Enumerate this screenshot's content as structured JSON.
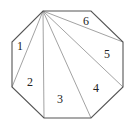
{
  "figure": {
    "vertices": [
      {
        "x": 43,
        "y": 11
      },
      {
        "x": 91,
        "y": 11
      },
      {
        "x": 123,
        "y": 42
      },
      {
        "x": 123,
        "y": 87
      },
      {
        "x": 91,
        "y": 118
      },
      {
        "x": 44,
        "y": 118
      },
      {
        "x": 12,
        "y": 87
      },
      {
        "x": 12,
        "y": 42
      }
    ],
    "fan_apex": {
      "x": 43,
      "y": 11
    },
    "diagonal_targets": [
      {
        "x": 12,
        "y": 87
      },
      {
        "x": 44,
        "y": 118
      },
      {
        "x": 91,
        "y": 118
      },
      {
        "x": 123,
        "y": 87
      },
      {
        "x": 123,
        "y": 42
      }
    ],
    "triangles": [
      {
        "label": "1",
        "x": 17,
        "y": 50
      },
      {
        "label": "2",
        "x": 27,
        "y": 86
      },
      {
        "label": "3",
        "x": 57,
        "y": 103
      },
      {
        "label": "4",
        "x": 93,
        "y": 92
      },
      {
        "label": "5",
        "x": 104,
        "y": 58
      },
      {
        "label": "6",
        "x": 83,
        "y": 25
      }
    ]
  }
}
